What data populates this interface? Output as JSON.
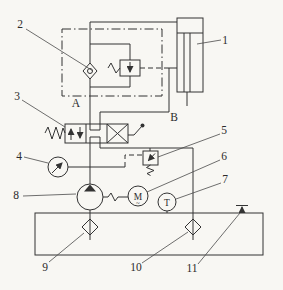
{
  "figure": {
    "background": "#f8f7f3",
    "stroke_color": "#333333",
    "callouts": {
      "c1": "1",
      "c2": "2",
      "c3": "3",
      "c4": "4",
      "c5": "5",
      "c6": "6",
      "c7": "7",
      "c8": "8",
      "c9": "9",
      "c10": "10",
      "c11": "11"
    },
    "ports": {
      "a": "A",
      "b": "B"
    },
    "glyphs": {
      "motor": "M",
      "motor_wave": "~",
      "thermometer": "T"
    },
    "symbols": {
      "c1": "hydraulic-cylinder",
      "c2": "check-valve-in-balance-unit",
      "c3": "manual-directional-valve",
      "c4": "pressure-gauge",
      "c5": "relief-valve",
      "c6": "electric-motor",
      "c7": "thermometer",
      "c8": "hydraulic-pump",
      "c9": "suction-filter",
      "c10": "return-filter",
      "c11": "air-breather"
    }
  }
}
